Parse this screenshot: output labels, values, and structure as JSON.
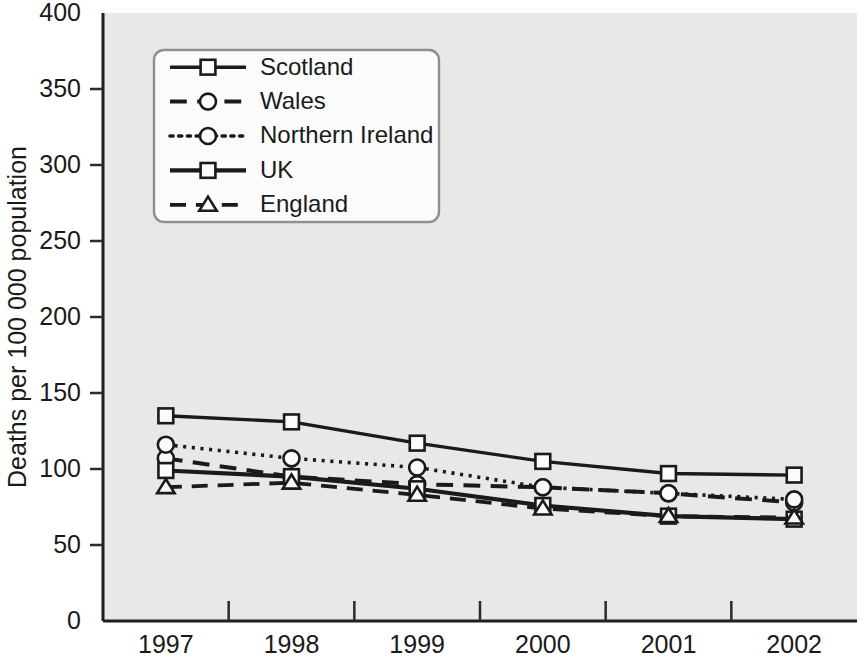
{
  "chart_data": {
    "type": "line",
    "title": "",
    "xlabel": "",
    "ylabel": "Deaths per 100 000 population",
    "categories": [
      "1997",
      "1998",
      "1999",
      "2000",
      "2001",
      "2002"
    ],
    "x": [
      1997,
      1998,
      1999,
      2000,
      2001,
      2002
    ],
    "ylim": [
      0,
      400
    ],
    "ytick_labels": [
      "0",
      "50",
      "100",
      "150",
      "200",
      "250",
      "300",
      "350",
      "400"
    ],
    "ytick_values": [
      0,
      50,
      100,
      150,
      200,
      250,
      300,
      350,
      400
    ],
    "grid": false,
    "legend_position": "upper-left-inset",
    "series": [
      {
        "name": "Scotland",
        "values": [
          135,
          131,
          117,
          105,
          97,
          96
        ],
        "line_style": "solid",
        "marker": "square",
        "line_width": 3.4
      },
      {
        "name": "Wales",
        "values": [
          107,
          95,
          90,
          88,
          84,
          78
        ],
        "line_style": "dashed",
        "marker": "circle",
        "line_width": 4.0
      },
      {
        "name": "Northern Ireland",
        "values": [
          116,
          107,
          101,
          88,
          84,
          80
        ],
        "line_style": "dotted",
        "marker": "circle",
        "line_width": 3.6
      },
      {
        "name": "UK",
        "values": [
          99,
          95,
          87,
          76,
          69,
          67
        ],
        "line_style": "solid",
        "marker": "square",
        "line_width": 4.2
      },
      {
        "name": "England",
        "values": [
          88,
          91,
          83,
          74,
          69,
          68
        ],
        "line_style": "dashed",
        "marker": "triangle",
        "line_width": 3.8
      }
    ]
  },
  "colors": {
    "plot_background": "#e8e8e8",
    "page_background": "#ffffff",
    "ink": "#1a1a1a",
    "border": "#3a3a3a",
    "marker_fill": "#fbfbfb",
    "legend_border": "#8f8f8f"
  },
  "legend": {
    "entries": [
      "Scotland",
      "Wales",
      "Northern Ireland",
      "UK",
      "England"
    ]
  }
}
